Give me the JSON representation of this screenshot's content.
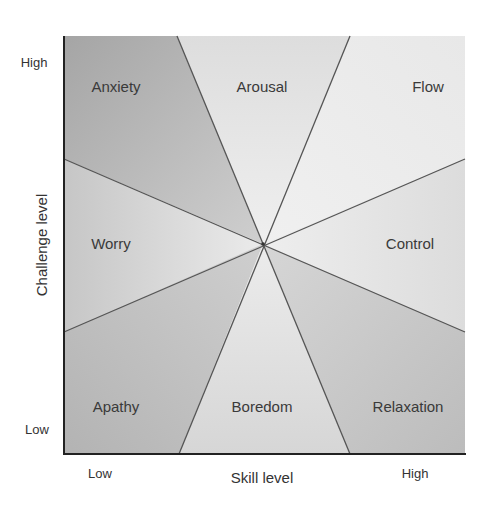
{
  "diagram": {
    "type": "flow-model-octants",
    "x_axis": {
      "title": "Skill level",
      "low_label": "Low",
      "high_label": "High"
    },
    "y_axis": {
      "title": "Challenge level",
      "low_label": "Low",
      "high_label": "High"
    },
    "regions": [
      {
        "name": "Anxiety",
        "position": "top-left"
      },
      {
        "name": "Arousal",
        "position": "top-center"
      },
      {
        "name": "Flow",
        "position": "top-right"
      },
      {
        "name": "Worry",
        "position": "middle-left"
      },
      {
        "name": "Control",
        "position": "middle-right"
      },
      {
        "name": "Apathy",
        "position": "bottom-left"
      },
      {
        "name": "Boredom",
        "position": "bottom-center"
      },
      {
        "name": "Relaxation",
        "position": "bottom-right"
      }
    ],
    "colors": {
      "axis": "#222222",
      "divider_lines": "#555555",
      "shade_dark": "#a9a9a9",
      "shade_mid": "#c8c8c8",
      "shade_light": "#ececec"
    }
  }
}
